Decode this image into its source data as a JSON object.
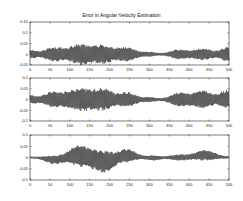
{
  "figure": {
    "title": "Error in Angular Velocity Estimation",
    "line_color": "#111111",
    "background": "#ffffff"
  },
  "chart_data": [
    {
      "type": "line",
      "title": "Error in Angular Velocity Estimation",
      "xlabel": "",
      "ylabel": "",
      "xlim": [
        0,
        500
      ],
      "ylim": [
        -0.05,
        0.15
      ],
      "xticks": [
        0,
        50,
        100,
        150,
        200,
        250,
        300,
        350,
        400,
        450,
        500
      ],
      "yticks": [
        -0.05,
        0,
        0.05,
        0.1,
        0.15
      ],
      "ytick_labels": [
        "-0.05",
        "0",
        "0.05",
        "0.1",
        "0.15"
      ],
      "grid": false,
      "envelope": {
        "centers": [
          5,
          60,
          125,
          185,
          245,
          300,
          375,
          435,
          495
        ],
        "amplitudes": [
          0.015,
          0.03,
          0.045,
          0.04,
          0.03,
          0.008,
          0.02,
          0.025,
          0.03
        ],
        "widths": [
          12,
          22,
          24,
          24,
          20,
          15,
          20,
          22,
          15
        ]
      }
    },
    {
      "type": "line",
      "title": "",
      "xlabel": "",
      "ylabel": "",
      "xlim": [
        0,
        500
      ],
      "ylim": [
        -0.1,
        0.1
      ],
      "xticks": [
        0,
        50,
        100,
        150,
        200,
        250,
        300,
        350,
        400,
        450,
        500
      ],
      "yticks": [
        -0.1,
        -0.05,
        0,
        0.05,
        0.1
      ],
      "ytick_labels": [
        "-0.1",
        "-0.05",
        "0",
        "0.05",
        "0.1"
      ],
      "grid": false,
      "envelope": {
        "centers": [
          5,
          60,
          125,
          185,
          245,
          300,
          375,
          435,
          495
        ],
        "amplitudes": [
          0.015,
          0.035,
          0.05,
          0.045,
          0.03,
          0.008,
          0.03,
          0.04,
          0.04
        ],
        "widths": [
          12,
          22,
          26,
          24,
          20,
          15,
          20,
          24,
          15
        ]
      }
    },
    {
      "type": "line",
      "title": "",
      "xlabel": "",
      "ylabel": "",
      "xlim": [
        0,
        500
      ],
      "ylim": [
        -0.1,
        0.1
      ],
      "xticks": [
        0,
        50,
        100,
        150,
        200,
        250,
        300,
        350,
        400,
        450,
        500
      ],
      "yticks": [
        -0.1,
        -0.05,
        0,
        0.05,
        0.1
      ],
      "ytick_labels": [
        "-0.1",
        "-0.05",
        "0",
        "0.05",
        "0.1"
      ],
      "grid": false,
      "envelope": {
        "centers": [
          60,
          125,
          185,
          245,
          310,
          375,
          440
        ],
        "amplitudes": [
          0.015,
          0.045,
          0.045,
          0.025,
          0.008,
          0.01,
          0.02
        ],
        "widths": [
          20,
          24,
          24,
          20,
          15,
          20,
          24
        ],
        "offsets": [
          -0.01,
          0.01,
          -0.02,
          0.01,
          -0.002,
          0.0,
          0.01
        ]
      }
    }
  ]
}
